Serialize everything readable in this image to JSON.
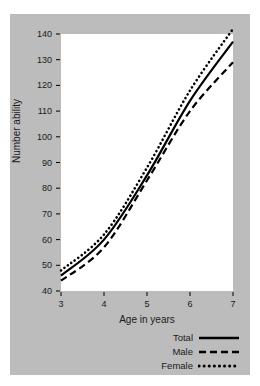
{
  "chart_data": {
    "type": "line",
    "title": "",
    "xlabel": "Age in years",
    "ylabel": "Number ability",
    "x": [
      3,
      4,
      5,
      6,
      7
    ],
    "xticks": [
      "3",
      "4",
      "5",
      "6",
      "7"
    ],
    "yticks": [
      "40",
      "50",
      "60",
      "70",
      "80",
      "90",
      "100",
      "110",
      "120",
      "130",
      "140"
    ],
    "xlim": [
      3,
      7
    ],
    "ylim": [
      40,
      140
    ],
    "grid": false,
    "legend_position": "below-right",
    "series": [
      {
        "name": "Total",
        "style": "solid",
        "color": "#000000",
        "values": [
          46,
          60,
          85,
          114,
          137
        ]
      },
      {
        "name": "Male",
        "style": "dashed",
        "color": "#000000",
        "values": [
          44,
          57,
          83,
          110,
          129
        ]
      },
      {
        "name": "Female",
        "style": "dotted",
        "color": "#000000",
        "values": [
          48,
          62,
          88,
          118,
          142
        ]
      }
    ]
  },
  "axis": {
    "x_label": "Age in years",
    "y_label": "Number ability"
  },
  "legend": {
    "items": [
      {
        "label": "Total",
        "style": "solid"
      },
      {
        "label": "Male",
        "style": "dashed"
      },
      {
        "label": "Female",
        "style": "dotted"
      }
    ]
  },
  "colors": {
    "panel_background": "#bcbcbc",
    "plot_background": "#ffffff",
    "ink": "#000000",
    "text": "#1a1a1a"
  }
}
